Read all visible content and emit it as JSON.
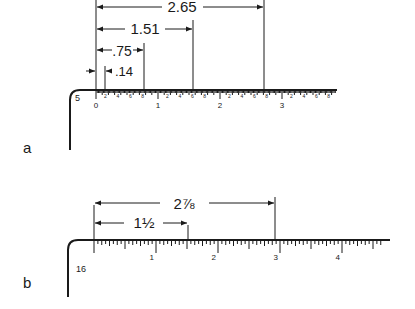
{
  "figure": {
    "panels": [
      {
        "id": "a",
        "label": "a",
        "scale_marker": "5",
        "scale_type": "decimal inch (tenths)",
        "inch_labels": [
          "0",
          "1",
          "2",
          "3"
        ],
        "minor_labels": [
          "2",
          "4",
          "6",
          "8"
        ],
        "measurements": [
          {
            "label": "2.65",
            "value": 2.65
          },
          {
            "label": "1.51",
            "value": 1.51
          },
          {
            "label": ".75",
            "value": 0.75
          },
          {
            "label": ".14",
            "value": 0.14
          }
        ]
      },
      {
        "id": "b",
        "label": "b",
        "scale_marker": "16",
        "scale_type": "inch (sixteenths)",
        "inch_labels": [
          "1",
          "2",
          "3",
          "4"
        ],
        "measurements": [
          {
            "label": "2⅞",
            "value": 2.875
          },
          {
            "label": "1½",
            "value": 1.5
          }
        ]
      }
    ]
  },
  "colors": {
    "ink": "#1a1a1a",
    "background": "#ffffff"
  }
}
